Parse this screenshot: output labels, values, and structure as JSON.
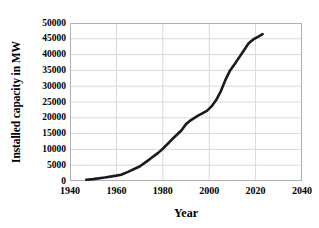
{
  "chart_data": {
    "type": "line",
    "title": "",
    "xlabel": "Year",
    "ylabel": "Installed capacity in MW",
    "xlim": [
      1940,
      2040
    ],
    "ylim": [
      0,
      50000
    ],
    "xticks": [
      "1940",
      "1960",
      "1980",
      "2000",
      "2020",
      "2040"
    ],
    "yticks": [
      "0",
      "5000",
      "10000",
      "15000",
      "20000",
      "25000",
      "30000",
      "35000",
      "40000",
      "45000",
      "50000"
    ],
    "grid": true,
    "legend": "none",
    "line_color": "#1a1a1a",
    "series": [
      {
        "name": "Installed capacity",
        "x": [
          1947,
          1950,
          1955,
          1960,
          1962,
          1965,
          1970,
          1974,
          1978,
          1980,
          1984,
          1988,
          1990,
          1992,
          1995,
          1997,
          1999,
          2001,
          2003,
          2005,
          2007,
          2009,
          2011,
          2013,
          2015,
          2017,
          2019,
          2021,
          2023
        ],
        "values": [
          400,
          600,
          1100,
          1700,
          2000,
          2900,
          4600,
          6700,
          8900,
          10200,
          13200,
          16000,
          18000,
          19200,
          20600,
          21400,
          22200,
          23600,
          25600,
          28400,
          32000,
          35000,
          37000,
          39200,
          41400,
          43600,
          44800,
          45600,
          46500
        ]
      }
    ]
  },
  "axis": {
    "x_title": "Year",
    "y_title": "Installed capacity in MW"
  }
}
